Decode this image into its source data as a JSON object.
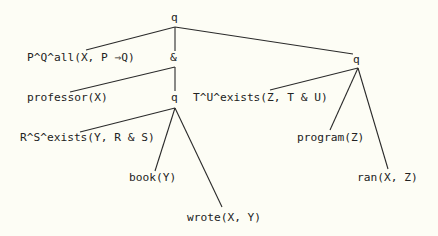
{
  "diagram": {
    "type": "tree",
    "colors": {
      "background": "#fdfdf5",
      "ink": "#222222"
    },
    "nodes": {
      "root": {
        "label": "q"
      },
      "all": {
        "label": "P^Q^all(X, P ⇒Q)"
      },
      "and": {
        "label": "&"
      },
      "professor": {
        "label": "professor(X)"
      },
      "q_mid": {
        "label": "q"
      },
      "exists_tu": {
        "label": "T^U^exists(Z, T & U)"
      },
      "exists_rs": {
        "label": "R^S^exists(Y, R & S)"
      },
      "book": {
        "label": "book(Y)"
      },
      "wrote": {
        "label": "wrote(X, Y)"
      },
      "q_right": {
        "label": "q"
      },
      "program": {
        "label": "program(Z)"
      },
      "ran": {
        "label": "ran(X, Z)"
      }
    },
    "edges": [
      [
        "root",
        "all"
      ],
      [
        "root",
        "and"
      ],
      [
        "root",
        "q_right"
      ],
      [
        "and",
        "professor"
      ],
      [
        "and",
        "q_mid"
      ],
      [
        "q_mid",
        "exists_rs"
      ],
      [
        "q_mid",
        "book"
      ],
      [
        "q_mid",
        "wrote"
      ],
      [
        "q_right",
        "exists_tu"
      ],
      [
        "q_right",
        "program"
      ],
      [
        "q_right",
        "ran"
      ]
    ]
  }
}
